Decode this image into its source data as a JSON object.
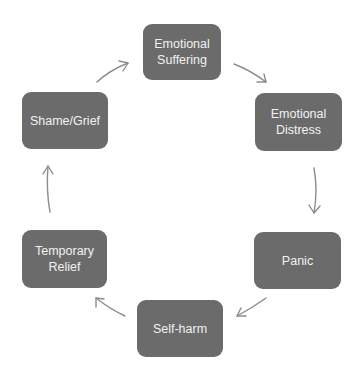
{
  "diagram": {
    "type": "cycle",
    "colors": {
      "node_fill": "#6b6b6b",
      "node_text": "#f2f2f2",
      "arrow": "#8c8c8c",
      "background": "#ffffff"
    },
    "nodes": [
      {
        "id": "emotional-suffering",
        "line1": "Emotional",
        "line2": "Suffering"
      },
      {
        "id": "emotional-distress",
        "line1": "Emotional",
        "line2": "Distress"
      },
      {
        "id": "panic",
        "line1": "Panic",
        "line2": ""
      },
      {
        "id": "self-harm",
        "line1": "Self-harm",
        "line2": ""
      },
      {
        "id": "temporary-relief",
        "line1": "Temporary",
        "line2": "Relief"
      },
      {
        "id": "shame-grief",
        "line1": "Shame/Grief",
        "line2": ""
      }
    ],
    "edges": [
      {
        "from": "emotional-suffering",
        "to": "emotional-distress"
      },
      {
        "from": "emotional-distress",
        "to": "panic"
      },
      {
        "from": "panic",
        "to": "self-harm"
      },
      {
        "from": "self-harm",
        "to": "temporary-relief"
      },
      {
        "from": "temporary-relief",
        "to": "shame-grief"
      },
      {
        "from": "shame-grief",
        "to": "emotional-suffering"
      }
    ]
  }
}
